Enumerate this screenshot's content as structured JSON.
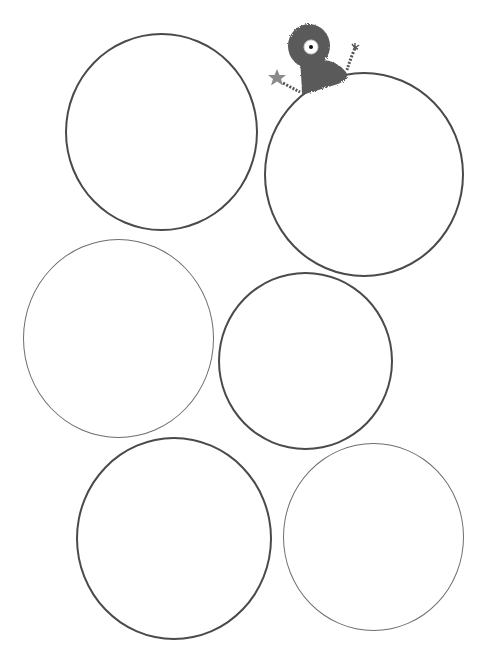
{
  "title": "Blank circles worksheet",
  "circles": [
    {
      "id": "circle-1",
      "cx": 161,
      "cy": 131,
      "r": 96
    },
    {
      "id": "circle-2",
      "cx": 364,
      "cy": 174,
      "r": 100
    },
    {
      "id": "circle-3",
      "cx": 118,
      "cy": 338,
      "r": 95
    },
    {
      "id": "circle-4",
      "cx": 305,
      "cy": 360,
      "r": 87
    },
    {
      "id": "circle-5",
      "cx": 174,
      "cy": 539,
      "r": 98
    },
    {
      "id": "circle-6",
      "cx": 373,
      "cy": 537,
      "r": 90
    }
  ],
  "decoration": {
    "name": "fuzzy one-eyed monster holding a star",
    "body_color": "#5a5a5a",
    "star_color": "#8a8a8a"
  }
}
